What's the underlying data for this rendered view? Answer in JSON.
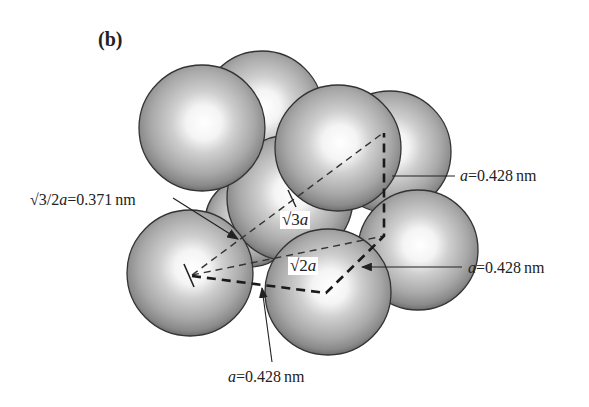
{
  "figure": {
    "panel_label": "(b)",
    "labels": {
      "half_body_diagonal": {
        "prefix": "√3/2",
        "var": "a",
        "value": "=0.371",
        "unit": "nm"
      },
      "edge_right_upper": {
        "var": "a",
        "value": "=0.428",
        "unit": "nm"
      },
      "edge_right_lower": {
        "var": "a",
        "value": "=0.428",
        "unit": "nm"
      },
      "edge_bottom": {
        "var": "a",
        "value": "=0.428",
        "unit": "nm"
      },
      "body_diagonal": {
        "prefix": "√3",
        "var": "a"
      },
      "face_diagonal": {
        "prefix": "√2",
        "var": "a"
      }
    },
    "colors": {
      "sphere_light": "#ffffff",
      "sphere_mid": "#bdbdbd",
      "sphere_dark": "#7a7a7a",
      "outline": "#333333",
      "line": "#222222"
    }
  }
}
